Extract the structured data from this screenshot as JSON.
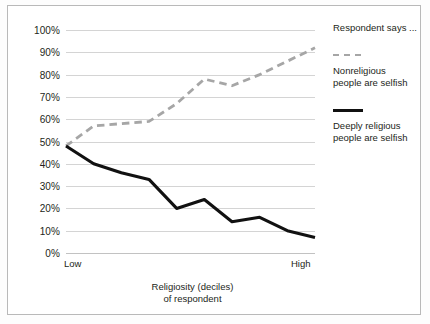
{
  "chart_data": {
    "type": "line",
    "title": "",
    "xlabel": "Religiosity (deciles)\nof respondent",
    "xlabel_line1": "Religiosity (deciles)",
    "xlabel_line2": "of respondent",
    "ylabel": "",
    "ylim": [
      0,
      100
    ],
    "xlim": [
      1,
      10
    ],
    "grid": true,
    "legend_position": "right",
    "legend_title": "Respondent says ...",
    "x_axis_endpoints": {
      "left": "Low",
      "right": "High"
    },
    "categories": [
      1,
      2,
      3,
      4,
      5,
      6,
      7,
      8,
      9,
      10
    ],
    "y_ticks": [
      "0%",
      "10%",
      "20%",
      "30%",
      "40%",
      "50%",
      "60%",
      "70%",
      "80%",
      "90%",
      "100%"
    ],
    "y_tick_values": [
      0,
      10,
      20,
      30,
      40,
      50,
      60,
      70,
      80,
      90,
      100
    ],
    "series": [
      {
        "name": "Nonreligious\npeople are selfish",
        "name_line1": "Nonreligious",
        "name_line2": "people are selfish",
        "style": "dashed",
        "color": "#a6a6a6",
        "values": [
          48,
          57,
          58,
          59,
          67,
          78,
          75,
          80,
          86,
          92
        ]
      },
      {
        "name": "Deeply religious\npeople are selfish",
        "name_line1": "Deeply religious",
        "name_line2": "people are selfish",
        "style": "solid",
        "color": "#111111",
        "values": [
          48,
          40,
          36,
          33,
          20,
          24,
          14,
          16,
          10,
          7
        ]
      }
    ]
  }
}
